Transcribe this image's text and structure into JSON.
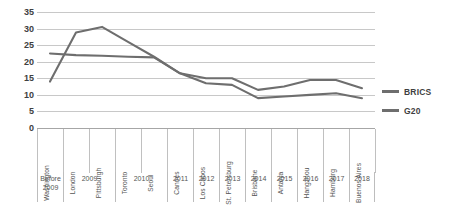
{
  "chart_data": {
    "type": "line",
    "title": "",
    "xlabel": "",
    "ylabel": "",
    "ylim": [
      0,
      35
    ],
    "ytick_step": 5,
    "yticks": [
      "35",
      "30",
      "25",
      "20",
      "15",
      "10",
      "5",
      "0"
    ],
    "grid": true,
    "legend_position": "right",
    "line_color": "#6e6e6e",
    "categories": [
      "Washington",
      "London",
      "Pittsburgh",
      "Toronto",
      "Seoul",
      "Cannes",
      "Los Cabos",
      "St. Petersburg",
      "Brisbane",
      "Antalya",
      "Hangzhou",
      "Hamburg",
      "Buenos Aires"
    ],
    "year_groups": [
      {
        "label": "Before\n2009",
        "span": 1
      },
      {
        "label": "2009",
        "span": 2
      },
      {
        "label": "2010",
        "span": 2
      },
      {
        "label": "2011",
        "span": 1
      },
      {
        "label": "2012",
        "span": 1
      },
      {
        "label": "2013",
        "span": 1
      },
      {
        "label": "2014",
        "span": 1
      },
      {
        "label": "2015",
        "span": 1
      },
      {
        "label": "2016",
        "span": 1
      },
      {
        "label": "2017",
        "span": 1
      },
      {
        "label": "2018",
        "span": 1
      }
    ],
    "series": [
      {
        "name": "BRICS",
        "values": [
          14.0,
          28.8,
          30.5,
          26.0,
          21.5,
          16.5,
          15.0,
          15.0,
          11.5,
          12.5,
          14.5,
          14.5,
          12.0
        ]
      },
      {
        "name": "G20",
        "values": [
          22.5,
          22.0,
          21.8,
          21.5,
          21.3,
          16.5,
          13.5,
          13.0,
          9.0,
          9.5,
          10.0,
          10.5,
          9.0
        ]
      }
    ]
  },
  "legend": {
    "entries": [
      {
        "label": "BRICS"
      },
      {
        "label": "G20"
      }
    ]
  }
}
